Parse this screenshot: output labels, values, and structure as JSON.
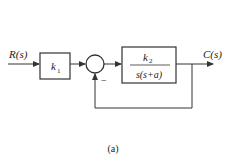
{
  "diagram": {
    "input_label": "R(s)",
    "output_label": "C(s)",
    "block1": {
      "label": "k",
      "subscript": "1"
    },
    "block2": {
      "numerator": "k",
      "numerator_subscript": "2",
      "denominator": "s(s+a)"
    },
    "summing_junction": {
      "feedback_sign": "−"
    },
    "caption": "(a)",
    "colors": {
      "line": "#333333",
      "background": "#ffffff"
    }
  }
}
